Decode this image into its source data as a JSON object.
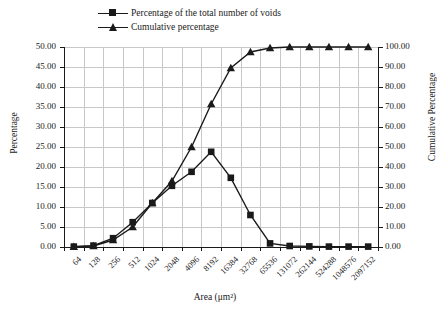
{
  "chart_data": {
    "type": "line",
    "title": "",
    "xlabel": "Area (μm²)",
    "ylabel": "Percentage",
    "ylabel_secondary": "Cumulative Percentage",
    "ylim": [
      0,
      50
    ],
    "ylim_secondary": [
      0,
      100
    ],
    "ytick_step": 5,
    "ytick_step_secondary": 10,
    "grid": true,
    "legend_position": "top",
    "categories": [
      "64",
      "128",
      "256",
      "512",
      "1024",
      "2048",
      "4096",
      "8192",
      "16384",
      "32768",
      "65536",
      "131072",
      "262144",
      "524288",
      "1048576",
      "2097152"
    ],
    "yticks": [
      "0.00",
      "5.00",
      "10.00",
      "15.00",
      "20.00",
      "25.00",
      "30.00",
      "35.00",
      "40.00",
      "45.00",
      "50.00"
    ],
    "yticks_secondary": [
      "0.00",
      "10.00",
      "20.00",
      "30.00",
      "40.00",
      "50.00",
      "60.00",
      "70.00",
      "80.00",
      "90.00",
      "100.00"
    ],
    "series": [
      {
        "name": "Percentage of the total number of voids",
        "axis": "left",
        "marker": "square",
        "color": "#1a1a1a",
        "values": [
          0.1,
          0.35,
          2.2,
          6.2,
          11.0,
          15.3,
          18.8,
          23.8,
          17.3,
          8.0,
          0.9,
          0.25,
          0.15,
          0.1,
          0.1,
          0.1
        ]
      },
      {
        "name": "Cumulative percentage",
        "axis": "right",
        "marker": "triangle",
        "color": "#1a1a1a",
        "values": [
          0.1,
          0.5,
          3.5,
          10.0,
          22.0,
          33.0,
          50.0,
          71.5,
          89.5,
          97.5,
          99.5,
          100.0,
          100.0,
          100.0,
          100.0,
          100.0
        ]
      }
    ]
  }
}
